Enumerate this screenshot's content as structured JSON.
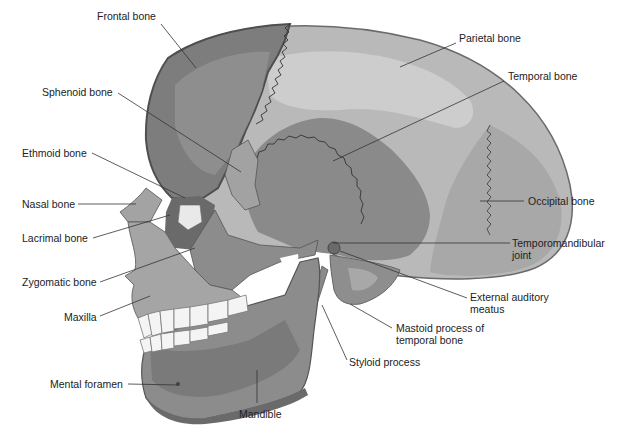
{
  "diagram": {
    "colors": {
      "frontal": "#7d7d7d",
      "frontal_highlight": "#8e8e8e",
      "frontal_rim": "#5a5a5a",
      "parietal": "#b9b9b9",
      "parietal_highlight": "#cdcdcd",
      "temporal": "#8a8a8a",
      "occipital": "#a9a9a9",
      "sphenoid": "#a0a0a0",
      "face": "#9a9a9a",
      "maxilla": "#a5a5a5",
      "mandible": "#8c8c8c",
      "mandible_dark": "#6e6e6e",
      "teeth": "#f4f4f4",
      "leader_line": "#333333",
      "label_text": "#222222"
    },
    "labels": [
      {
        "id": "frontal-bone",
        "text": "Frontal bone",
        "x": 97,
        "y": 16,
        "align": "left",
        "line": [
          [
            161,
            24
          ],
          [
            196,
            68
          ]
        ]
      },
      {
        "id": "parietal-bone",
        "text": "Parietal bone",
        "x": 459,
        "y": 38,
        "align": "left",
        "line": [
          [
            456,
            43
          ],
          [
            400,
            67
          ]
        ]
      },
      {
        "id": "temporal-bone",
        "text": "Temporal bone",
        "x": 508,
        "y": 76,
        "align": "left",
        "line": [
          [
            504,
            81
          ],
          [
            333,
            161
          ]
        ]
      },
      {
        "id": "sphenoid-bone",
        "text": "Sphenoid bone",
        "x": 42,
        "y": 88,
        "align": "left",
        "line": [
          [
            118,
            93
          ],
          [
            241,
            172
          ]
        ]
      },
      {
        "id": "ethmoid-bone",
        "text": "Ethmoid bone",
        "x": 22,
        "y": 148,
        "align": "left",
        "line": [
          [
            92,
            153
          ],
          [
            185,
            198
          ]
        ]
      },
      {
        "id": "nasal-bone",
        "text": "Nasal bone",
        "x": 22,
        "y": 199,
        "align": "left",
        "line": [
          [
            78,
            204
          ],
          [
            136,
            204
          ]
        ]
      },
      {
        "id": "occipital-bone",
        "text": "Occipital bone",
        "x": 528,
        "y": 196,
        "align": "left",
        "line": [
          [
            524,
            201
          ],
          [
            480,
            201
          ]
        ]
      },
      {
        "id": "lacrimal-bone",
        "text": "Lacrimal bone",
        "x": 22,
        "y": 232,
        "align": "left",
        "line": [
          [
            93,
            238
          ],
          [
            170,
            215
          ]
        ]
      },
      {
        "id": "temporomandibular-joint",
        "text": "Temporomandibular\njoint",
        "x": 512,
        "y": 238,
        "align": "left",
        "line": [
          [
            510,
            243
          ],
          [
            333,
            243
          ]
        ]
      },
      {
        "id": "zygomatic-bone",
        "text": "Zygomatic bone",
        "x": 22,
        "y": 276,
        "align": "left",
        "line": [
          [
            100,
            282
          ],
          [
            195,
            248
          ]
        ]
      },
      {
        "id": "external-auditory-meatus",
        "text": "External auditory\nmeatus",
        "x": 470,
        "y": 292,
        "align": "left",
        "line": [
          [
            467,
            298
          ],
          [
            340,
            251
          ]
        ]
      },
      {
        "id": "maxilla",
        "text": "Maxilla",
        "x": 64,
        "y": 311,
        "align": "left",
        "line": [
          [
            100,
            316
          ],
          [
            150,
            296
          ]
        ]
      },
      {
        "id": "mastoid-process",
        "text": "Mastoid process of\ntemporal bone",
        "x": 395,
        "y": 323,
        "align": "left",
        "line": [
          [
            392,
            328
          ],
          [
            350,
            304
          ]
        ]
      },
      {
        "id": "styloid-process",
        "text": "Styloid process",
        "x": 349,
        "y": 357,
        "align": "left",
        "line": [
          [
            347,
            360
          ],
          [
            322,
            305
          ]
        ]
      },
      {
        "id": "mental-foramen",
        "text": "Mental foramen",
        "x": 50,
        "y": 379,
        "align": "left",
        "line": [
          [
            128,
            384
          ],
          [
            178,
            385
          ]
        ]
      },
      {
        "id": "mandible",
        "text": "Mandible",
        "x": 239,
        "y": 408,
        "align": "left",
        "line": [
          [
            257,
            403
          ],
          [
            257,
            370
          ]
        ]
      }
    ]
  }
}
